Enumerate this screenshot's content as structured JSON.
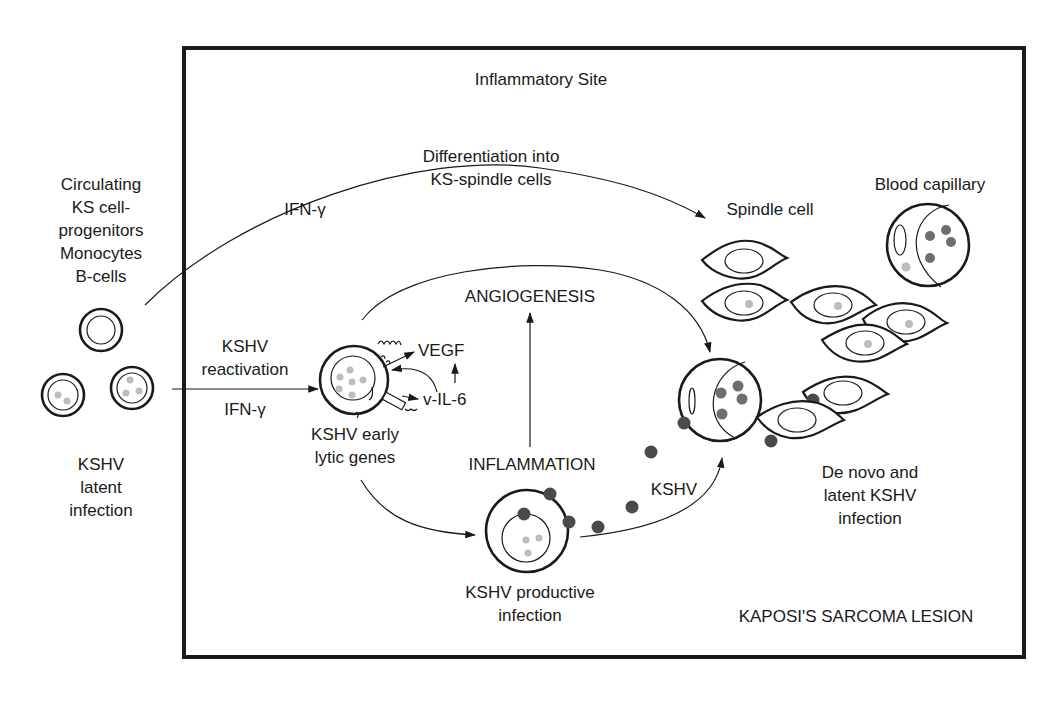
{
  "frame": {
    "title": "Inflammatory Site",
    "lesion_label": "KAPOSI'S SARCOMA LESION"
  },
  "left_panel": {
    "circulating_label": [
      "Circulating",
      "KS cell-",
      "progenitors",
      "Monocytes",
      "B-cells"
    ],
    "latent_label": [
      "KSHV",
      "latent",
      "infection"
    ]
  },
  "pathways": {
    "differentiation_label": [
      "Differentiation into",
      "KS-spindle cells"
    ],
    "ifn_top": "IFN-γ",
    "reactivation_label": [
      "KSHV",
      "reactivation"
    ],
    "ifn_bottom": "IFN-γ",
    "kshv_virion_label": "KSHV"
  },
  "lytic_cell": {
    "label": [
      "KSHV early",
      "lytic genes"
    ],
    "vegf": "VEGF",
    "vil6": "v-IL-6"
  },
  "processes": {
    "angiogenesis": "ANGIOGENESIS",
    "inflammation": "INFLAMMATION"
  },
  "productive_cell": {
    "label": [
      "KSHV productive",
      "infection"
    ]
  },
  "lesion": {
    "spindle_cell": "Spindle cell",
    "blood_capillary": "Blood capillary",
    "denovo_label": [
      "De novo and",
      "latent KSHV",
      "infection"
    ]
  },
  "colors": {
    "line": "#1a1a1a",
    "virion_dark": "#4a4a4a",
    "virion_mid": "#6e6e6e",
    "episome_light": "#bdbdbd",
    "background": "#ffffff"
  }
}
